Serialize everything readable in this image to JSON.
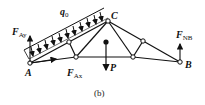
{
  "diagram": {
    "type": "truss free-body diagram",
    "caption": "(b)",
    "points": {
      "A": "A",
      "B": "B",
      "C": "C"
    },
    "loads": {
      "distributed": {
        "symbol": "q",
        "subscript": "0"
      },
      "point": {
        "symbol": "P"
      }
    },
    "reactions": {
      "FAy": {
        "symbol": "F",
        "subscript": "Ay"
      },
      "FAx": {
        "symbol": "F",
        "subscript": "Ax"
      },
      "FNB": {
        "symbol": "F",
        "subscript": "NB"
      }
    },
    "colors": {
      "line": "#111111",
      "background": "#ffffff"
    }
  }
}
